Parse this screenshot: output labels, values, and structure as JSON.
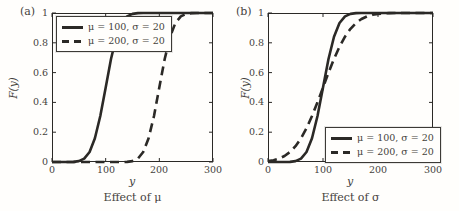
{
  "figure": {
    "background": "#fffefc",
    "line_color": "#2b2926",
    "text_color": "#45423c"
  },
  "chart_data": [
    {
      "type": "line",
      "panel_tag": "(a)",
      "title": "Effect of μ",
      "xlabel": "y",
      "ylabel": "F(y)",
      "xlim": [
        0,
        300
      ],
      "ylim": [
        0,
        1
      ],
      "x_ticks": [
        0,
        100,
        200,
        300
      ],
      "y_ticks": [
        1,
        0.8,
        0.6,
        0.4,
        0.2,
        0
      ],
      "grid": false,
      "legend_position": "top-left",
      "legend_entries": [
        {
          "style": "solid",
          "label": "μ = 100, σ = 20"
        },
        {
          "style": "dashed",
          "label": "μ = 200, σ = 20"
        }
      ],
      "series": [
        {
          "name": "μ = 100, σ = 20",
          "line": "solid",
          "x": [
            0,
            10,
            20,
            30,
            40,
            50,
            60,
            70,
            80,
            90,
            100,
            110,
            120,
            130,
            140,
            150,
            160,
            170,
            180,
            190,
            200,
            210,
            220,
            230,
            240,
            250,
            260,
            270,
            280,
            290,
            300
          ],
          "y": [
            0,
            0,
            0,
            0,
            0.001,
            0.006,
            0.023,
            0.067,
            0.159,
            0.309,
            0.5,
            0.691,
            0.841,
            0.933,
            0.977,
            0.994,
            0.999,
            1,
            1,
            1,
            1,
            1,
            1,
            1,
            1,
            1,
            1,
            1,
            1,
            1,
            1
          ]
        },
        {
          "name": "μ = 200, σ = 20",
          "line": "dashed",
          "x": [
            0,
            10,
            20,
            30,
            40,
            50,
            60,
            70,
            80,
            90,
            100,
            110,
            120,
            130,
            140,
            150,
            160,
            170,
            180,
            190,
            200,
            210,
            220,
            230,
            240,
            250,
            260,
            270,
            280,
            290,
            300
          ],
          "y": [
            0,
            0,
            0,
            0,
            0,
            0,
            0,
            0,
            0,
            0,
            0,
            0,
            0,
            0,
            0.001,
            0.006,
            0.023,
            0.067,
            0.159,
            0.309,
            0.5,
            0.691,
            0.841,
            0.933,
            0.977,
            0.994,
            0.999,
            1,
            1,
            1,
            1
          ]
        }
      ]
    },
    {
      "type": "line",
      "panel_tag": "(b)",
      "title": "Effect of σ",
      "xlabel": "y",
      "ylabel": "F(y)",
      "xlim": [
        0,
        300
      ],
      "ylim": [
        0,
        1
      ],
      "x_ticks": [
        0,
        100,
        200,
        300
      ],
      "y_ticks": [
        1,
        0.8,
        0.6,
        0.4,
        0.2,
        0
      ],
      "grid": false,
      "legend_position": "bottom-right",
      "legend_entries": [
        {
          "style": "solid",
          "label": "μ = 100, σ = 20"
        },
        {
          "style": "dashed",
          "label": "μ = 200, σ = 20"
        }
      ],
      "series": [
        {
          "name": "μ = 100, σ = 20",
          "line": "solid",
          "x": [
            0,
            10,
            20,
            30,
            40,
            50,
            60,
            70,
            80,
            90,
            100,
            110,
            120,
            130,
            140,
            150,
            160,
            170,
            180,
            190,
            200,
            210,
            220,
            230,
            240,
            250,
            260,
            270,
            280,
            290,
            300
          ],
          "y": [
            0,
            0,
            0,
            0,
            0.001,
            0.006,
            0.023,
            0.067,
            0.159,
            0.309,
            0.5,
            0.691,
            0.841,
            0.933,
            0.977,
            0.994,
            0.999,
            1,
            1,
            1,
            1,
            1,
            1,
            1,
            1,
            1,
            1,
            1,
            1,
            1,
            1
          ]
        },
        {
          "name": "μ = 200, σ = 20",
          "line": "dashed",
          "x": [
            0,
            10,
            20,
            30,
            40,
            50,
            60,
            70,
            80,
            90,
            100,
            110,
            120,
            130,
            140,
            150,
            160,
            170,
            180,
            190,
            200,
            210,
            220,
            230,
            240,
            250,
            260,
            270,
            280,
            290,
            300
          ],
          "y": [
            0.006,
            0.012,
            0.023,
            0.04,
            0.067,
            0.106,
            0.159,
            0.227,
            0.309,
            0.401,
            0.5,
            0.599,
            0.691,
            0.773,
            0.841,
            0.894,
            0.933,
            0.96,
            0.977,
            0.988,
            0.994,
            0.997,
            0.999,
            1,
            1,
            1,
            1,
            1,
            1,
            1,
            1
          ]
        }
      ]
    }
  ]
}
